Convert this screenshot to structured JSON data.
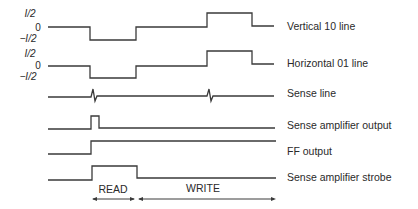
{
  "diagram": {
    "title": "",
    "level_labels": {
      "group1": {
        "high": "I/2",
        "zero": "0",
        "low": "−I/2"
      },
      "group2": {
        "high": "I/2",
        "zero": "0",
        "low": "−I/2"
      }
    },
    "signals": [
      {
        "id": "vertical",
        "label": "Vertical 10 line"
      },
      {
        "id": "horizontal",
        "label": "Horizontal 01 line"
      },
      {
        "id": "sense",
        "label": "Sense line"
      },
      {
        "id": "sense-amp-out",
        "label": "Sense amplifier output"
      },
      {
        "id": "ff-out",
        "label": "FF output"
      },
      {
        "id": "strobe",
        "label": "Sense amplifier strobe"
      }
    ],
    "phases": [
      {
        "label": "READ"
      },
      {
        "label": "WRITE"
      }
    ]
  }
}
